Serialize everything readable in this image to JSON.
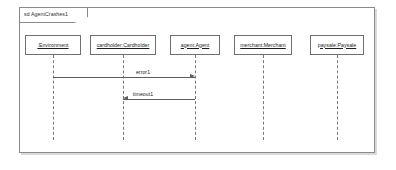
{
  "diagram": {
    "kind": "uml-sequence-diagram",
    "frame_label": "sd AgentCrashes1",
    "lifelines": [
      {
        "id": "environment",
        "label": ":Environment",
        "box_left": 25,
        "box_width": 56,
        "stem_x": 53
      },
      {
        "id": "cardholder",
        "label": "cardholder:Cardholder",
        "box_left": 90,
        "box_width": 66,
        "stem_x": 123
      },
      {
        "id": "agent",
        "label": "agent:Agent",
        "box_left": 170,
        "box_width": 50,
        "stem_x": 195
      },
      {
        "id": "merchant",
        "label": "merchant:Merchant",
        "box_left": 234,
        "box_width": 58,
        "stem_x": 263
      },
      {
        "id": "paysale",
        "label": "paysale:Paysale",
        "box_left": 310,
        "box_width": 54,
        "stem_x": 337
      }
    ],
    "messages": [
      {
        "id": "error1",
        "label": "error1",
        "from": "environment",
        "to": "agent",
        "direction": "right",
        "y": 77,
        "x_start": 53,
        "x_end": 195,
        "label_x": 143,
        "label_y": 69
      },
      {
        "id": "timeout1",
        "label": "timeout1",
        "from": "agent",
        "to": "cardholder",
        "direction": "left",
        "y": 99,
        "x_start": 123,
        "x_end": 195,
        "label_x": 143,
        "label_y": 91
      }
    ],
    "geometry": {
      "head_top": 35,
      "head_height": 20,
      "stem_top": 55,
      "stem_bottom": 140
    },
    "colors": {
      "frame_border": "#8a8a8a",
      "box_border": "#6f6f6f",
      "lifeline": "#7a7a7a",
      "message": "#5d5d5d",
      "text": "#1c1c1c",
      "background": "#ffffff",
      "shadow": "#d9d9d9"
    }
  }
}
